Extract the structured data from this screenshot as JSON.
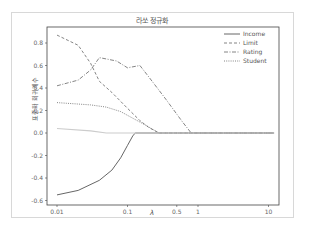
{
  "chart_data": {
    "type": "line",
    "title": "라쏘 정규화",
    "xlabel": "λ",
    "ylabel": "표준화 회귀계수",
    "xscale": "log",
    "xticks": [
      0.01,
      0.1,
      0.5,
      1,
      10
    ],
    "xtick_labels": [
      "0.01",
      "0.1",
      "0.5",
      "1",
      "10"
    ],
    "yticks": [
      -0.6,
      -0.4,
      -0.2,
      0.0,
      0.2,
      0.4,
      0.6,
      0.8
    ],
    "ytick_labels": [
      "-0.6",
      "-0.4",
      "-0.2",
      "0.0",
      "0.2",
      "0.4",
      "0.6",
      "0.8"
    ],
    "xlim": [
      0.007,
      14
    ],
    "ylim": [
      -0.63,
      0.95
    ],
    "legend_position": "upper right",
    "series": [
      {
        "name": "Income",
        "style": "solid",
        "color": "#555555",
        "x": [
          0.01,
          0.02,
          0.04,
          0.06,
          0.08,
          0.1,
          0.12,
          0.13,
          1,
          12
        ],
        "values": [
          -0.55,
          -0.51,
          -0.42,
          -0.33,
          -0.22,
          -0.11,
          -0.02,
          0.0,
          0.0,
          0.0
        ]
      },
      {
        "name": "Limit",
        "style": "dashed",
        "color": "#777777",
        "x": [
          0.01,
          0.02,
          0.03,
          0.04,
          0.06,
          0.1,
          0.15,
          0.2,
          0.28,
          1,
          12
        ],
        "values": [
          0.87,
          0.78,
          0.62,
          0.46,
          0.36,
          0.22,
          0.11,
          0.05,
          0.0,
          0.0,
          0.0
        ]
      },
      {
        "name": "Rating",
        "style": "dashdot",
        "color": "#777777",
        "x": [
          0.01,
          0.02,
          0.03,
          0.04,
          0.07,
          0.1,
          0.15,
          0.2,
          0.35,
          0.6,
          0.8,
          12
        ],
        "values": [
          0.42,
          0.47,
          0.56,
          0.67,
          0.64,
          0.58,
          0.6,
          0.5,
          0.3,
          0.1,
          0.0,
          0.0
        ]
      },
      {
        "name": "Student",
        "style": "dotted",
        "color": "#777777",
        "x": [
          0.01,
          0.03,
          0.05,
          0.08,
          0.12,
          0.18,
          0.28,
          1,
          12
        ],
        "values": [
          0.27,
          0.25,
          0.23,
          0.19,
          0.13,
          0.07,
          0.0,
          0.0,
          0.0
        ]
      },
      {
        "name": "others",
        "style": "solid",
        "color": "#cccccc",
        "x": [
          0.01,
          0.03,
          0.05,
          12
        ],
        "values": [
          0.04,
          0.02,
          0.0,
          0.0
        ]
      }
    ]
  }
}
